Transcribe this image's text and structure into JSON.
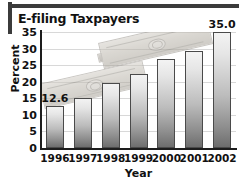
{
  "title": "E-filing Taxpayers",
  "chart_data": {
    "type": "bar",
    "title": "E-filing Taxpayers",
    "xlabel": "Year",
    "ylabel": "Percent",
    "categories": [
      "1996",
      "1997",
      "1998",
      "1999",
      "2000",
      "2001",
      "2002"
    ],
    "values": [
      12.6,
      15.0,
      19.6,
      22.3,
      27.0,
      29.3,
      35.0
    ],
    "data_labels": [
      {
        "category": "1996",
        "text": "12.6"
      },
      {
        "category": "2002",
        "text": "35.0"
      }
    ],
    "ylim": [
      0,
      35
    ],
    "ytick_labels": [
      "0",
      "5",
      "10",
      "15",
      "20",
      "25",
      "30",
      "35"
    ],
    "ytick_values": [
      0,
      5,
      10,
      15,
      20,
      25,
      30,
      35
    ],
    "grid": true,
    "legend": "none",
    "annotation": "dollar-bills-watermark"
  },
  "colors": {
    "frame": "#3b3b3b",
    "axis": "#1d1d1d",
    "gridline": "#d8d8d8",
    "bar_top": "#f3f3f3",
    "bar_bottom": "#6e6e6e",
    "bar_outline": "#4a4a4a",
    "text": "#111111",
    "background": "#ffffff"
  }
}
